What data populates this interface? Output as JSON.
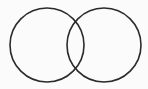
{
  "diagram": {
    "type": "venn",
    "background": "#fbfbfb",
    "stroke_color": "#2b2b2b",
    "stroke_width": 1.6,
    "circles": [
      {
        "id": "left",
        "cx": 47,
        "cy": 45,
        "r": 37
      },
      {
        "id": "right",
        "cx": 104,
        "cy": 45,
        "r": 37
      }
    ]
  }
}
